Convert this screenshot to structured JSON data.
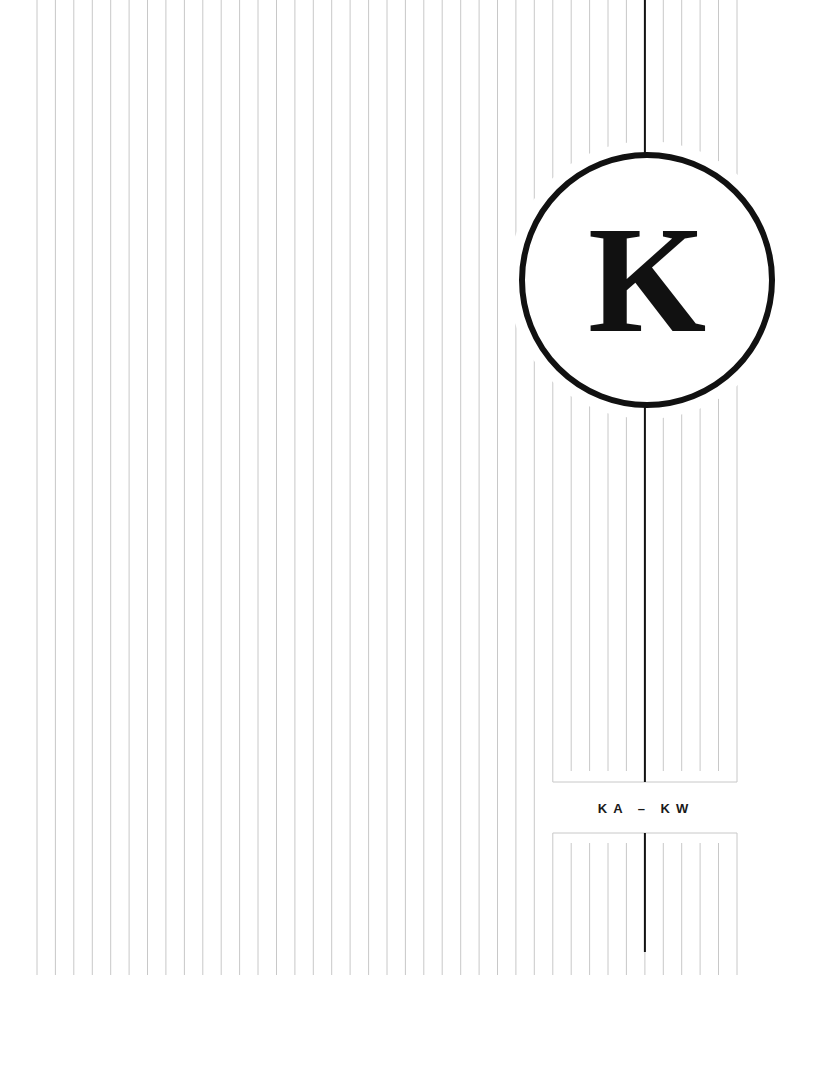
{
  "cover": {
    "letter": "K",
    "range_label": "KA – KW"
  },
  "colors": {
    "background": "#ffffff",
    "rule_lines": "#c8c8c8",
    "accent": "#111111"
  },
  "layout": {
    "line_start_x": 37,
    "line_spacing": 18.42,
    "line_count": 39,
    "lines_bottom_y": 975,
    "center_line_index": 33,
    "box_left_index": 28,
    "box_right_index": 38,
    "circle": {
      "cx": 647,
      "cy": 280,
      "r": 125,
      "stroke": 6,
      "mask_r": 139
    },
    "upper_box_bottom_y": 782,
    "upper_inner_end_y": 771,
    "lower_box_top_y": 833,
    "lower_inner_start_y": 843,
    "center_line_end_y": 952
  }
}
